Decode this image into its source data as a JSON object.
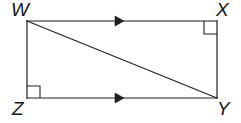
{
  "figure": {
    "type": "geometry-diagram",
    "shape": "rectangle-with-diagonal",
    "background_color": "#ffffff",
    "stroke_color": "#231f20",
    "stroke_width": 1.2,
    "canvas": {
      "width": 241,
      "height": 123
    },
    "vertices": [
      {
        "id": "W",
        "label": "W",
        "x": 27,
        "y": 21,
        "position": "top-left"
      },
      {
        "id": "X",
        "label": "X",
        "x": 217,
        "y": 21,
        "position": "top-right"
      },
      {
        "id": "Y",
        "label": "Y",
        "x": 217,
        "y": 98,
        "position": "bottom-right"
      },
      {
        "id": "Z",
        "label": "Z",
        "x": 27,
        "y": 98,
        "position": "bottom-left"
      }
    ],
    "edges": [
      {
        "id": "WX",
        "from": "W",
        "to": "X",
        "name": "top-edge"
      },
      {
        "id": "XY",
        "from": "X",
        "to": "Y",
        "name": "right-edge"
      },
      {
        "id": "ZY",
        "from": "Z",
        "to": "Y",
        "name": "bottom-edge"
      },
      {
        "id": "WZ",
        "from": "W",
        "to": "Z",
        "name": "left-edge"
      }
    ],
    "diagonal": {
      "id": "WY",
      "from": "W",
      "to": "Y",
      "name": "diagonal-WY"
    },
    "right_angle_marks": [
      {
        "at": "X",
        "size": 13,
        "name": "right-angle-mark-X"
      },
      {
        "at": "Z",
        "size": 12,
        "name": "right-angle-mark-Z"
      }
    ],
    "parallel_marks": [
      {
        "on_edge": "WX",
        "ticks": 1,
        "direction": "right",
        "x": 120,
        "y": 21,
        "name": "parallel-arrow-top"
      },
      {
        "on_edge": "ZY",
        "ticks": 1,
        "direction": "right",
        "x": 120,
        "y": 98,
        "name": "parallel-arrow-bottom"
      }
    ]
  }
}
